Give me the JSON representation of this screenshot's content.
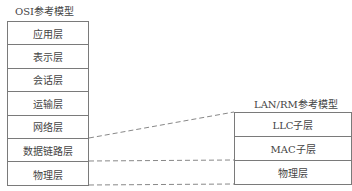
{
  "osi": {
    "title": "OSI参考模型",
    "layers": [
      "应用层",
      "表示层",
      "会话层",
      "运输层",
      "网络层",
      "数据链路层",
      "物理层"
    ]
  },
  "lan": {
    "title": "LAN/RM参考模型",
    "layers": [
      "LLC子层",
      "MAC子层",
      "物理层"
    ]
  },
  "mapping": [
    {
      "from": "数据链路层 (top)",
      "to": "LLC子层 (top)"
    },
    {
      "from": "数据链路层 (bottom)",
      "to": "MAC子层 (bottom)"
    },
    {
      "from": "物理层 (bottom)",
      "to": "物理层 (bottom)"
    }
  ],
  "colors": {
    "border": "#7a7a7a",
    "text": "#444444",
    "dash": "#888888"
  }
}
